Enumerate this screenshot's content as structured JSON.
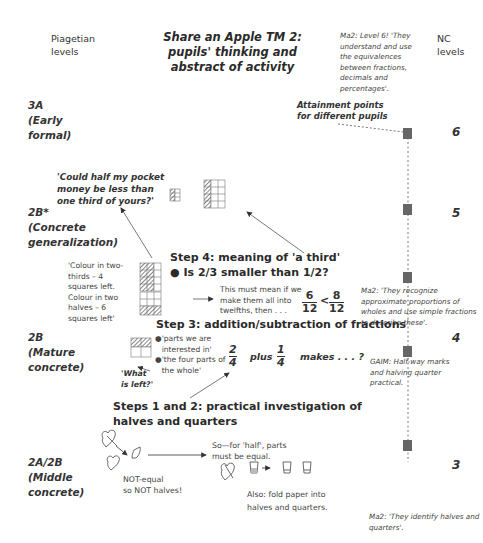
{
  "header": {
    "left_label": "Piagetian\nlevels",
    "title": "Share an Apple TM 2:\npupils' thinking and\nabstract of activity",
    "right_label": "NC\nlevels"
  },
  "ma2_notes": {
    "level6": "Ma2: Level 6! 'They understand and use the equivalences between fractions, decimals and percentages'.",
    "level4": "Ma2: 'They recognize approximate proportions of wholes and use simple fractions to describe these'.",
    "gaim": "GAIM: Half-way marks and halving quarter practical.",
    "level2": "Ma2: 'They identify halves and quarters'."
  },
  "attainment_label": "Attainment points\nfor different pupils",
  "piagetian_levels": [
    {
      "code": "3A",
      "name": "(Early\nformal)"
    },
    {
      "code": "2B*",
      "name": "(Concrete\ngeneralization)"
    },
    {
      "code": "2B",
      "name": "(Mature\nconcrete)"
    },
    {
      "code": "2A/2B",
      "name": "(Middle\nconcrete)"
    }
  ],
  "nc_levels": [
    "6",
    "5",
    "4",
    "3"
  ],
  "question": "'Could half my pocket money be less than one third of yours?'",
  "step4": {
    "heading": "Step 4: meaning of 'a third'",
    "bullet": "Is 2/3 smaller than 1/2?",
    "colour_note": "'Colour in two-thirds – 4 squares left.\nColour in two halves – 6 squares left'",
    "explain": "This must mean if we make them all into twelfths, then . . .",
    "frac_left": {
      "num": "6",
      "den": "12"
    },
    "comparator": "<",
    "frac_right": {
      "num": "8",
      "den": "12"
    }
  },
  "step3": {
    "heading": "Step 3: addition/subtraction of fractions",
    "bullets": [
      "'parts we are interested in'",
      "'the four parts of the whole'"
    ],
    "what_left": "'What\nis left?'",
    "frac_a": {
      "num": "2",
      "den": "4"
    },
    "plus": "plus",
    "frac_b": {
      "num": "1",
      "den": "4"
    },
    "makes": "makes . . . ?"
  },
  "steps12": {
    "heading": "Steps 1 and 2: practical investigation of\nhalves and quarters",
    "not_equal": "NOT-equal\nso NOT halves!",
    "half_note": "So—for 'half', parts\nmust be equal.",
    "fold_note": "Also: fold paper into\nhalves and quarters."
  }
}
